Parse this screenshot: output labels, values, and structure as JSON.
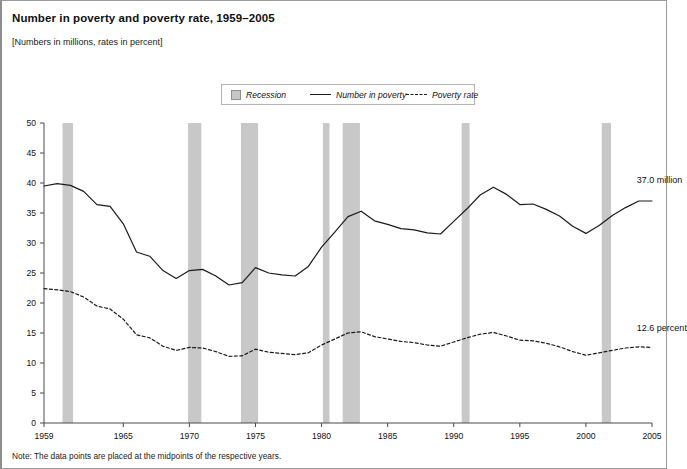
{
  "figure": {
    "title": "Number in poverty and poverty rate, 1959–2005",
    "subtitle": "[Numbers in millions, rates in percent]",
    "note": "Note: The data points are placed at the midpoints of the respective years."
  },
  "legend": {
    "recession_label": "Recession",
    "count_label": "Number in poverty",
    "rate_label": "Poverty rate"
  },
  "annotations": {
    "count_end": "37.0 million",
    "rate_end": "12.6 percent"
  },
  "colors": {
    "recession_band": "#c8c8c8",
    "line": "#1b1b1b",
    "axis": "#4a4a4a",
    "border": "#9a9a9a",
    "background": "#ffffff"
  },
  "chart_data": {
    "type": "line",
    "title": "Number in poverty and poverty rate, 1959–2005",
    "subtitle": "[Numbers in millions, rates in percent]",
    "xlabel": "",
    "ylabel": "",
    "xlim": [
      1959,
      2005
    ],
    "ylim": [
      0,
      50
    ],
    "yticks": [
      0,
      5,
      10,
      15,
      20,
      25,
      30,
      35,
      40,
      45,
      50
    ],
    "ytick_labels": [
      "0",
      "5",
      "10",
      "15",
      "20",
      "25",
      "30",
      "35",
      "40",
      "45",
      "50"
    ],
    "xticks": [
      1959,
      1965,
      1970,
      1975,
      1980,
      1985,
      1990,
      1995,
      2000,
      2005
    ],
    "xtick_labels": [
      "1959",
      "1965",
      "1970",
      "1975",
      "1980",
      "1985",
      "1990",
      "1995",
      "2000",
      "2005"
    ],
    "grid": false,
    "legend_position": "top-center",
    "x": [
      1959,
      1960,
      1961,
      1962,
      1963,
      1964,
      1965,
      1966,
      1967,
      1968,
      1969,
      1970,
      1971,
      1972,
      1973,
      1974,
      1975,
      1976,
      1977,
      1978,
      1979,
      1980,
      1981,
      1982,
      1983,
      1984,
      1985,
      1986,
      1987,
      1988,
      1989,
      1990,
      1991,
      1992,
      1993,
      1994,
      1995,
      1996,
      1997,
      1998,
      1999,
      2000,
      2001,
      2002,
      2003,
      2004,
      2005
    ],
    "series": [
      {
        "name": "Number in poverty",
        "units": "millions",
        "style": "solid",
        "values": [
          39.5,
          39.9,
          39.6,
          38.6,
          36.4,
          36.1,
          33.2,
          28.5,
          27.8,
          25.4,
          24.1,
          25.4,
          25.6,
          24.5,
          23.0,
          23.4,
          25.9,
          25.0,
          24.7,
          24.5,
          26.1,
          29.3,
          31.8,
          34.4,
          35.3,
          33.7,
          33.1,
          32.4,
          32.2,
          31.7,
          31.5,
          33.6,
          35.7,
          38.0,
          39.3,
          38.1,
          36.4,
          36.5,
          35.6,
          34.5,
          32.8,
          31.6,
          32.9,
          34.6,
          35.9,
          37.0,
          37.0
        ]
      },
      {
        "name": "Poverty rate",
        "units": "percent",
        "style": "dashed",
        "values": [
          22.4,
          22.2,
          21.9,
          21.0,
          19.5,
          19.0,
          17.3,
          14.7,
          14.2,
          12.8,
          12.1,
          12.6,
          12.5,
          11.9,
          11.1,
          11.2,
          12.3,
          11.8,
          11.6,
          11.4,
          11.7,
          13.0,
          14.0,
          15.0,
          15.2,
          14.4,
          14.0,
          13.6,
          13.4,
          13.0,
          12.8,
          13.5,
          14.2,
          14.8,
          15.1,
          14.5,
          13.8,
          13.7,
          13.3,
          12.7,
          11.9,
          11.3,
          11.7,
          12.1,
          12.5,
          12.7,
          12.6
        ]
      }
    ],
    "recession_bands": [
      {
        "start": 1960.4,
        "end": 1961.2
      },
      {
        "start": 1969.9,
        "end": 1970.9
      },
      {
        "start": 1973.9,
        "end": 1975.2
      },
      {
        "start": 1980.1,
        "end": 1980.6
      },
      {
        "start": 1981.6,
        "end": 1982.9
      },
      {
        "start": 1990.6,
        "end": 1991.2
      },
      {
        "start": 2001.2,
        "end": 2001.9
      }
    ],
    "endpoint_annotations": [
      {
        "series": "Number in poverty",
        "text": "37.0 million",
        "x": 2005,
        "y": 37.0
      },
      {
        "series": "Poverty rate",
        "text": "12.6 percent",
        "x": 2005,
        "y": 12.6
      }
    ]
  }
}
